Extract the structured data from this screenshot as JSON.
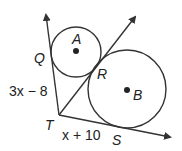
{
  "diagram": {
    "points": {
      "A": "A",
      "B": "B",
      "Q": "Q",
      "R": "R",
      "T": "T",
      "S": "S"
    },
    "segments": {
      "TQ": "3x − 8",
      "TS": "x + 10"
    },
    "colors": {
      "stroke": "#333333",
      "text": "#222222",
      "background": "#ffffff"
    }
  }
}
